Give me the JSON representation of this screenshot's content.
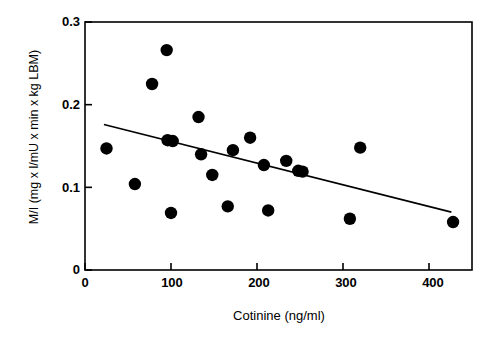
{
  "chart_data": {
    "type": "scatter",
    "title": "",
    "xlabel": "Cotinine  (ng/ml)",
    "ylabel": "M/I (mg x l/mU x min x kg LBM)",
    "xlim": [
      0,
      450
    ],
    "ylim": [
      0,
      0.3
    ],
    "xticks": [
      0,
      100,
      200,
      300,
      400
    ],
    "xtick_labels": [
      "0",
      "100",
      "200",
      "300",
      "400"
    ],
    "yticks": [
      0,
      0.1,
      0.2,
      0.3
    ],
    "ytick_labels": [
      "0",
      "0.1",
      "0.2",
      "0.3"
    ],
    "grid": false,
    "legend": null,
    "marker_color": "#000000",
    "line_color": "#000000",
    "points": [
      {
        "x": 25,
        "y": 0.147
      },
      {
        "x": 58,
        "y": 0.104
      },
      {
        "x": 78,
        "y": 0.225
      },
      {
        "x": 95,
        "y": 0.266
      },
      {
        "x": 96,
        "y": 0.157
      },
      {
        "x": 102,
        "y": 0.156
      },
      {
        "x": 100,
        "y": 0.069
      },
      {
        "x": 132,
        "y": 0.185
      },
      {
        "x": 135,
        "y": 0.14
      },
      {
        "x": 148,
        "y": 0.115
      },
      {
        "x": 166,
        "y": 0.077
      },
      {
        "x": 172,
        "y": 0.145
      },
      {
        "x": 192,
        "y": 0.16
      },
      {
        "x": 208,
        "y": 0.127
      },
      {
        "x": 213,
        "y": 0.072
      },
      {
        "x": 234,
        "y": 0.132
      },
      {
        "x": 248,
        "y": 0.12
      },
      {
        "x": 253,
        "y": 0.119
      },
      {
        "x": 308,
        "y": 0.062
      },
      {
        "x": 320,
        "y": 0.148
      },
      {
        "x": 428,
        "y": 0.058
      }
    ],
    "trendline": {
      "x0": 22,
      "y0": 0.176,
      "x1": 426,
      "y1": 0.07
    }
  }
}
